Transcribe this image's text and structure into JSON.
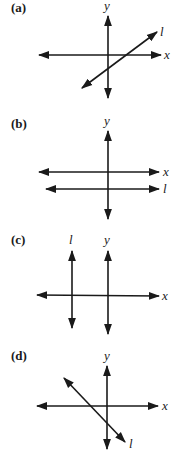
{
  "figure": {
    "panels": [
      {
        "id": "a",
        "label": "(a)",
        "x_axis_label": "x",
        "y_axis_label": "y",
        "line_label": "l",
        "line_description": "positive slope line crossing both axes"
      },
      {
        "id": "b",
        "label": "(b)",
        "x_axis_label": "x",
        "y_axis_label": "y",
        "line_label": "l",
        "line_description": "horizontal line below x-axis"
      },
      {
        "id": "c",
        "label": "(c)",
        "x_axis_label": "x",
        "y_axis_label": "y",
        "line_label": "l",
        "line_description": "vertical line left of y-axis"
      },
      {
        "id": "d",
        "label": "(d)",
        "x_axis_label": "x",
        "y_axis_label": "y",
        "line_label": "l",
        "line_description": "negative slope line crossing both axes"
      }
    ],
    "colors": {
      "ink": "#1a1a1a",
      "background": "#ffffff"
    }
  }
}
